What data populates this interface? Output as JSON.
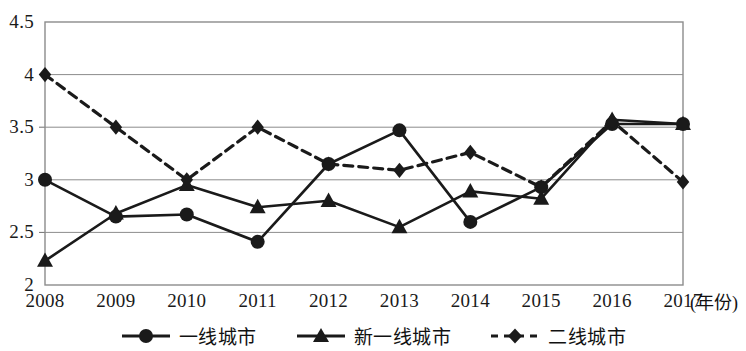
{
  "chart_data": {
    "type": "line",
    "title": "",
    "subtitle": "",
    "xlabel": "(年份)",
    "ylabel": "",
    "categories": [
      "2008",
      "2009",
      "2010",
      "2011",
      "2012",
      "2013",
      "2014",
      "2015",
      "2016",
      "2017"
    ],
    "x": [
      2008,
      2009,
      2010,
      2011,
      2012,
      2013,
      2014,
      2015,
      2016,
      2017
    ],
    "xlim": [
      2008,
      2017
    ],
    "ylim": [
      2,
      4.5
    ],
    "ytick_labels": [
      "2",
      "2.5",
      "3",
      "3.5",
      "4",
      "4.5"
    ],
    "yticks": [
      2,
      2.5,
      3,
      3.5,
      4,
      4.5
    ],
    "grid": true,
    "grid_axis": "y",
    "legend_position": "bottom",
    "series": [
      {
        "name": "一线城市",
        "marker": "circle",
        "line_style": "solid",
        "color": "#1a1a1a",
        "values": [
          3.0,
          2.65,
          2.67,
          2.41,
          3.15,
          3.47,
          2.6,
          2.93,
          3.53,
          3.53
        ]
      },
      {
        "name": "新一线城市",
        "marker": "triangle",
        "line_style": "solid",
        "color": "#1a1a1a",
        "values": [
          2.23,
          2.68,
          2.95,
          2.74,
          2.8,
          2.55,
          2.89,
          2.82,
          3.57,
          3.53
        ]
      },
      {
        "name": "二线城市",
        "marker": "diamond",
        "line_style": "dashed",
        "color": "#1a1a1a",
        "values": [
          4.0,
          3.5,
          3.0,
          3.5,
          3.15,
          3.09,
          3.26,
          2.93,
          3.56,
          2.98
        ]
      }
    ]
  },
  "axis": {
    "x_title": "(年份)"
  },
  "legend": {
    "items": [
      {
        "label": "一线城市",
        "marker": "circle-marker-icon",
        "dashed": false
      },
      {
        "label": "新一线城市",
        "marker": "triangle-marker-icon",
        "dashed": false
      },
      {
        "label": "二线城市",
        "marker": "diamond-marker-icon",
        "dashed": true
      }
    ]
  }
}
